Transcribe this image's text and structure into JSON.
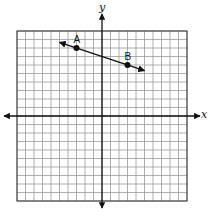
{
  "diagram": {
    "type": "coordinate-plane",
    "grid": {
      "x_min": -10,
      "x_max": 10,
      "y_min": -10,
      "y_max": 10,
      "cell_px": 8.5,
      "origin_px": [
        102,
        116
      ],
      "line_color": "#9a9a9a",
      "border_color": "#333333"
    },
    "axes": {
      "x_label": "x",
      "y_label": "y",
      "color": "#111111"
    },
    "line": {
      "through": [
        "A",
        "B"
      ],
      "extends_to_x": [
        -5,
        5
      ],
      "color": "#111111",
      "arrows": "both"
    },
    "points": [
      {
        "label": "A",
        "x": -3,
        "y": 8
      },
      {
        "label": "B",
        "x": 3,
        "y": 6
      }
    ]
  }
}
